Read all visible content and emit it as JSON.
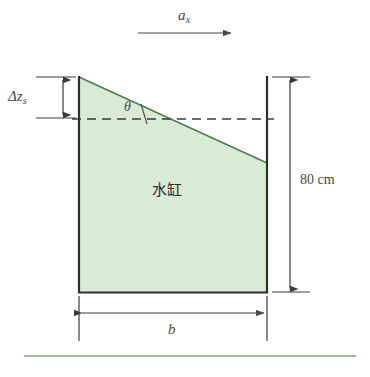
{
  "figure": {
    "background_color": "#ffffff",
    "water_fill_color": "#d9ebd4",
    "water_surface_color": "#4a7a4a",
    "outline_color": "#2e2e2e",
    "rule_color": "#7da97d"
  },
  "labels": {
    "acceleration": {
      "symbol": "a",
      "subscript": "x",
      "description": "horizontal acceleration arrow pointing right"
    },
    "delta_z": {
      "symbol": "Δz",
      "subscript": "s",
      "description": "rise of water surface at the left wall"
    },
    "theta": {
      "symbol": "θ",
      "description": "tilt angle of the free water surface"
    },
    "height": {
      "value": "80 cm",
      "description": "tank height dimension on the right side"
    },
    "width": {
      "symbol": "b",
      "description": "tank width dimension along the bottom"
    },
    "tank_caption": {
      "text": "水缸",
      "description": "water vat / water tank"
    }
  },
  "geometry": {
    "tank_left_x": 78,
    "tank_right_x": 268,
    "tank_top_y": 76,
    "tank_bottom_y": 293,
    "water_left_y": 76,
    "water_right_y": 162,
    "still_level_y": 119,
    "accel_arrow": {
      "x1": 138,
      "x2": 232,
      "y": 33
    },
    "height_dim": {
      "x": 290,
      "y1": 78,
      "y2": 291
    },
    "width_dim": {
      "y": 313,
      "x1": 80,
      "x2": 266
    },
    "delta_dim": {
      "x": 63,
      "y1": 78,
      "y2": 117
    },
    "bottom_rule": {
      "x1": 24,
      "x2": 356,
      "y": 356
    }
  }
}
